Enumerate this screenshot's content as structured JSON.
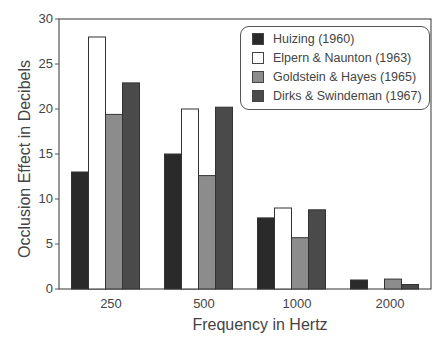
{
  "chart_data": {
    "type": "bar",
    "title": "",
    "xlabel": "Frequency in Hertz",
    "ylabel": "Occlusion Effect in Decibels",
    "ylim": [
      0,
      30
    ],
    "yticks": [
      0,
      5,
      10,
      15,
      20,
      25,
      30
    ],
    "grid": false,
    "legend_position": "upper right",
    "categories": [
      "250",
      "500",
      "1000",
      "2000"
    ],
    "series": [
      {
        "name": "Huizing (1960)",
        "color": "#2a2a2a",
        "values": [
          13,
          15,
          7.9,
          1
        ]
      },
      {
        "name": "Elpern & Naunton (1963)",
        "color": "#ffffff",
        "values": [
          28,
          20,
          9,
          0
        ]
      },
      {
        "name": "Goldstein & Hayes (1965)",
        "color": "#8c8c8c",
        "values": [
          19.4,
          12.6,
          5.7,
          1.1
        ]
      },
      {
        "name": "Dirks & Swindeman (1967)",
        "color": "#4a4a4a",
        "values": [
          22.9,
          20.2,
          8.8,
          0.5
        ]
      }
    ]
  },
  "labels": {
    "xlabel": "Frequency in Hertz",
    "ylabel": "Occlusion Effect in Decibels",
    "yticks": [
      "0",
      "5",
      "10",
      "15",
      "20",
      "25",
      "30"
    ],
    "xticks": [
      "250",
      "500",
      "1000",
      "2000"
    ],
    "legend": [
      "Huizing (1960)",
      "Elpern & Naunton (1963)",
      "Goldstein & Hayes (1965)",
      "Dirks & Swindeman (1967)"
    ]
  }
}
